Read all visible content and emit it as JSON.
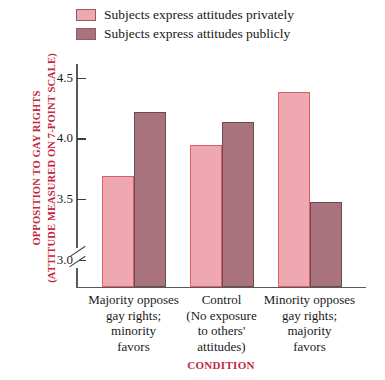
{
  "chart_data": {
    "type": "bar",
    "title": "",
    "xlabel": "CONDITION",
    "ylabel": "OPPOSITION TO GAY RIGHTS (ATTITUDE MEASURED ON 7-POINT SCALE)",
    "ylabel_line1": "OPPOSITION TO GAY RIGHTS",
    "ylabel_line2": "(ATTITUDE MEASURED ON 7-POINT SCALE)",
    "ylim": [
      2.78,
      4.62
    ],
    "yticks": [
      "4.5",
      "4.0",
      "3.5",
      "3.0"
    ],
    "ytick_values": [
      4.5,
      4.0,
      3.5,
      3.0
    ],
    "axis_break": true,
    "grid": false,
    "legend_position": "top",
    "categories": [
      "Majority opposes gay rights; minority favors",
      "Control (No exposure to others' attitudes)",
      "Minority opposes gay rights; majority favors"
    ],
    "category_lines": [
      [
        "Majority opposes",
        "gay rights;",
        "minority",
        "favors"
      ],
      [
        "Control",
        "(No exposure",
        "to others'",
        "attitudes)"
      ],
      [
        "Minority opposes",
        "gay rights;",
        "majority",
        "favors"
      ]
    ],
    "series": [
      {
        "name": "Subjects express attitudes privately",
        "color": "#f0a8b0",
        "values": [
          3.7,
          3.95,
          4.39
        ]
      },
      {
        "name": "Subjects express attitudes publicly",
        "color": "#a8737d",
        "values": [
          4.22,
          4.14,
          3.48
        ]
      }
    ]
  },
  "legend": {
    "items": [
      {
        "label": "Subjects express attitudes privately",
        "color": "#f0a8b0"
      },
      {
        "label": "Subjects express attitudes publicly",
        "color": "#a8737d"
      }
    ]
  },
  "colors": {
    "private": "#f0a8b0",
    "public": "#a8737d",
    "accent": "#c3283c",
    "axis": "#5a5a5a"
  }
}
